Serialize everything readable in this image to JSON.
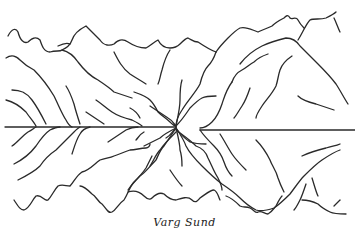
{
  "artwork": {
    "subject": "Mountains reflected in a fjord (line sketch)",
    "caption": "Varg Sund",
    "ink_color": "#2a2a2a",
    "paper_color": "#ffffff"
  }
}
